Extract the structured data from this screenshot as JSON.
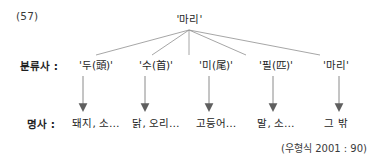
{
  "figure": {
    "example_number": "(57)",
    "citation": "(우형식 2001 : 90)"
  },
  "root": {
    "label": "'마리'"
  },
  "rows": {
    "classifier_label": "분류사 :",
    "noun_label": "명사 :"
  },
  "branches": [
    {
      "classifier": "'두(頭)'",
      "classifier_hangul": "두",
      "classifier_hanja": "頭",
      "noun": "돼지, 소…"
    },
    {
      "classifier": "'수(首)'",
      "classifier_hangul": "수",
      "classifier_hanja": "首",
      "noun": "닭, 오리…"
    },
    {
      "classifier": "'미(尾)'",
      "classifier_hangul": "미",
      "classifier_hanja": "尾",
      "noun": "고등어…"
    },
    {
      "classifier": "'필(匹)'",
      "classifier_hangul": "필",
      "classifier_hanja": "匹",
      "noun": "말, 소…"
    },
    {
      "classifier": "'마리'",
      "classifier_hangul": "마리",
      "classifier_hanja": "",
      "noun": "그 밖"
    }
  ],
  "style": {
    "line_color": "#8a8a8a",
    "arrow_color": "#6e6e6e",
    "text_color": "#262626",
    "background": "#ffffff"
  }
}
